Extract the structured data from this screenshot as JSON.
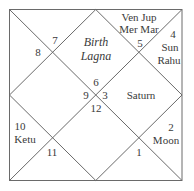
{
  "chart": {
    "type": "north-indian-birth-chart",
    "title_lines": [
      "Birth",
      "Lagna"
    ],
    "line_color": "#6a6a6a",
    "text_color": "#3a3a3a",
    "houses": [
      {
        "house": 1,
        "sign": "6",
        "planets": []
      },
      {
        "house": 2,
        "sign": "5",
        "planets": [
          "Ven",
          "Jup",
          "Mer",
          "Mar"
        ]
      },
      {
        "house": 3,
        "sign": "4",
        "planets": [
          "Sun",
          "Rahu"
        ]
      },
      {
        "house": 4,
        "sign": "3",
        "planets": [
          "Saturn"
        ]
      },
      {
        "house": 5,
        "sign": "2",
        "planets": [
          "Moon"
        ]
      },
      {
        "house": 6,
        "sign": "1",
        "planets": []
      },
      {
        "house": 7,
        "sign": "12",
        "planets": []
      },
      {
        "house": 8,
        "sign": "11",
        "planets": []
      },
      {
        "house": 9,
        "sign": "10",
        "planets": [
          "Ketu"
        ]
      },
      {
        "house": 10,
        "sign": "9",
        "planets": []
      },
      {
        "house": 11,
        "sign": "8",
        "planets": []
      },
      {
        "house": 12,
        "sign": "7",
        "planets": []
      }
    ],
    "labels": {
      "lagna_top": "Birth",
      "lagna_bottom": "Lagna",
      "h2_line1": "Ven Jup",
      "h2_line2": "Mer Mar",
      "h3_line1": "Sun",
      "h3_line2": "Rahu",
      "h4": "Saturn",
      "h5": "Moon",
      "h9": "Ketu"
    }
  }
}
